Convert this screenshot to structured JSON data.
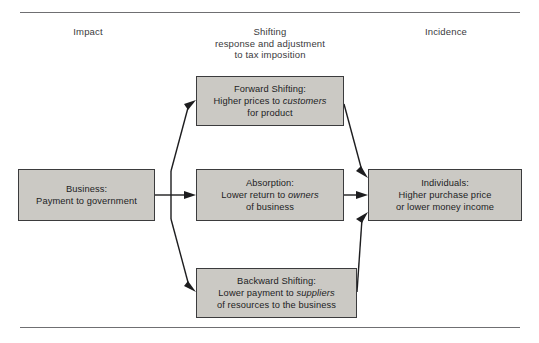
{
  "figure": {
    "columns": [
      {
        "id": "impact",
        "label": "Impact"
      },
      {
        "id": "shifting",
        "label": "Shifting\nresponse and adjustment\nto tax imposition"
      },
      {
        "id": "incidence",
        "label": "Incidence"
      }
    ],
    "nodes": {
      "business": {
        "title": "Business:",
        "line2_pre": "Payment to government",
        "line2_em": "",
        "line2_post": "",
        "line3": ""
      },
      "forward": {
        "title": "Forward Shifting:",
        "line2_pre": "Higher prices to ",
        "line2_em": "customers",
        "line2_post": "",
        "line3": "for product"
      },
      "absorption": {
        "title": "Absorption:",
        "line2_pre": "Lower return to ",
        "line2_em": "owners",
        "line2_post": "",
        "line3": "of business"
      },
      "backward": {
        "title": "Backward Shifting:",
        "line2_pre": "Lower payment to ",
        "line2_em": "suppliers",
        "line2_post": "",
        "line3": "of resources to the business"
      },
      "individuals": {
        "title": "Individuals:",
        "line2_pre": "Higher purchase price",
        "line2_em": "",
        "line2_post": "",
        "line3": "or lower money income"
      }
    },
    "colors": {
      "box_fill": "#cbc9c4",
      "box_border": "#3b3b3d",
      "rule": "#6f6f72",
      "arrow": "#1d1d1f",
      "text": "#1d1d1f",
      "heading_text": "#3a3a3c",
      "background": "#ffffff"
    },
    "flows": [
      {
        "id": "business-to-forward",
        "from": "business",
        "to": "forward"
      },
      {
        "id": "business-to-absorption",
        "from": "business",
        "to": "absorption"
      },
      {
        "id": "business-to-backward",
        "from": "business",
        "to": "backward"
      },
      {
        "id": "forward-to-individuals",
        "from": "forward",
        "to": "individuals"
      },
      {
        "id": "absorption-to-individuals",
        "from": "absorption",
        "to": "individuals"
      },
      {
        "id": "backward-to-individuals",
        "from": "backward",
        "to": "individuals"
      }
    ]
  }
}
